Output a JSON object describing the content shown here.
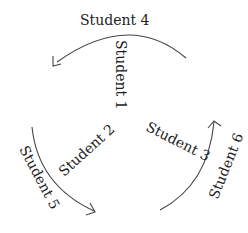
{
  "diagram": {
    "type": "circular-rotation",
    "labels": {
      "student_4": "Student 4",
      "student_1": "Student 1",
      "student_2": "Student 2",
      "student_5": "Student 5",
      "student_3": "Student 3",
      "student_6": "Student 6"
    },
    "arrows": [
      {
        "name": "top-arc",
        "direction": "right-to-left",
        "between": [
          "Student 4",
          "Student 1"
        ]
      },
      {
        "name": "left-arc",
        "direction": "top-to-bottom",
        "between": [
          "Student 5",
          "Student 2"
        ]
      },
      {
        "name": "right-arc",
        "direction": "bottom-to-top",
        "between": [
          "Student 3",
          "Student 6"
        ]
      }
    ],
    "colors": {
      "line": "#444444",
      "text": "#222222",
      "background": "#ffffff"
    }
  }
}
